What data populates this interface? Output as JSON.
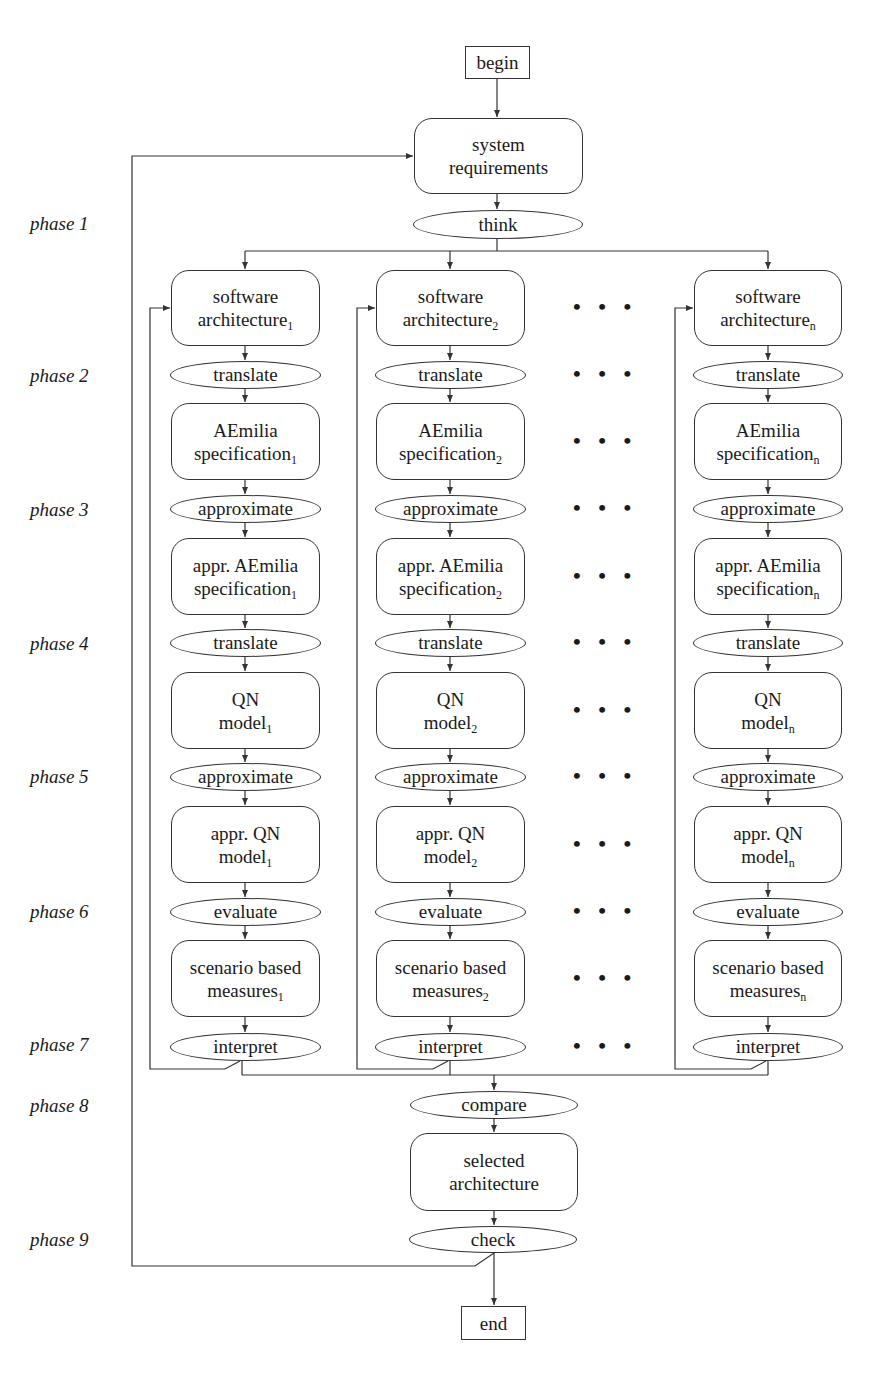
{
  "diagram": {
    "type": "flowchart",
    "start": "begin",
    "finish": "end",
    "top": {
      "system_requirements": [
        "system",
        "requirements"
      ],
      "think": "think"
    },
    "phases": [
      "phase 1",
      "phase 2",
      "phase 3",
      "phase 4",
      "phase 5",
      "phase 6",
      "phase 7",
      "phase 8",
      "phase 9"
    ],
    "columns": [
      {
        "id": "1",
        "sub": "1"
      },
      {
        "id": "2",
        "sub": "2"
      },
      {
        "id": "n",
        "sub": "n"
      }
    ],
    "column_steps": {
      "software_architecture": [
        "software",
        "architecture"
      ],
      "translate_1": "translate",
      "aemilia_spec": [
        "AEmilia",
        "specification"
      ],
      "approximate_1": "approximate",
      "appr_aemilia_spec": [
        "appr. AEmilia",
        "specification"
      ],
      "translate_2": "translate",
      "qn_model": [
        "QN",
        "model"
      ],
      "approximate_2": "approximate",
      "appr_qn_model": [
        "appr. QN",
        "model"
      ],
      "evaluate": "evaluate",
      "scenario_measures": [
        "scenario based",
        "measures"
      ],
      "interpret": "interpret"
    },
    "ellipsis": "• • •",
    "bottom": {
      "compare": "compare",
      "selected_architecture": [
        "selected",
        "architecture"
      ],
      "check": "check"
    },
    "colors": {
      "stroke": "#333333",
      "background": "#ffffff",
      "text": "#1a1a1a"
    }
  }
}
